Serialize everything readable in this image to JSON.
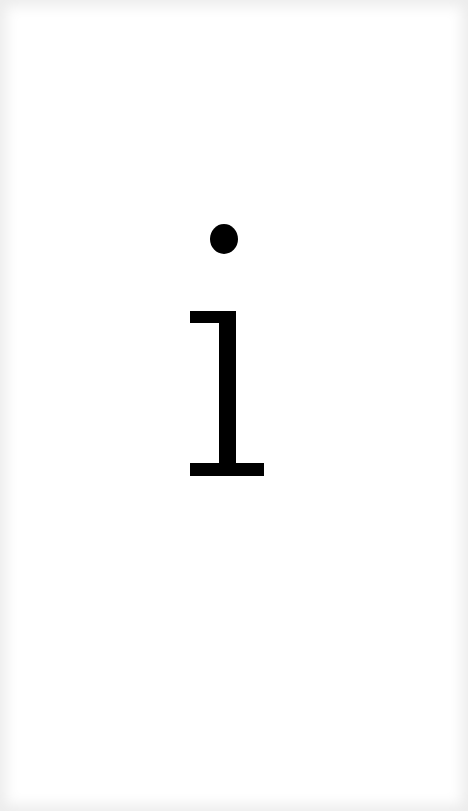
{
  "glyph": {
    "character": "i",
    "color": "#000000"
  },
  "background": {
    "color": "#ffffff",
    "edge_tint": "#ececec"
  }
}
